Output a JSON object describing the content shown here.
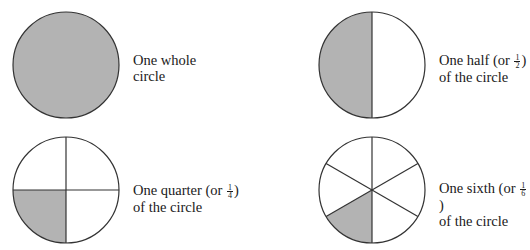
{
  "colors": {
    "shade": "#b3b3b3",
    "stroke": "#333333",
    "background": "#ffffff"
  },
  "figures": [
    {
      "name": "whole",
      "label_line1": "One whole",
      "label_line2": "circle",
      "fraction": null
    },
    {
      "name": "half",
      "label_line1_prefix": "One half (or ",
      "label_line1_suffix": ")",
      "label_line2": "of the circle",
      "fraction": {
        "num": "1",
        "den": "2"
      }
    },
    {
      "name": "quarter",
      "label_line1_prefix": "One quarter (or ",
      "label_line1_suffix": ")",
      "label_line2": "of the circle",
      "fraction": {
        "num": "1",
        "den": "4"
      }
    },
    {
      "name": "sixth",
      "label_line1_prefix": "One sixth (or ",
      "label_line1_suffix": ")",
      "label_line2": "of the circle",
      "fraction": {
        "num": "1",
        "den": "6"
      }
    }
  ]
}
